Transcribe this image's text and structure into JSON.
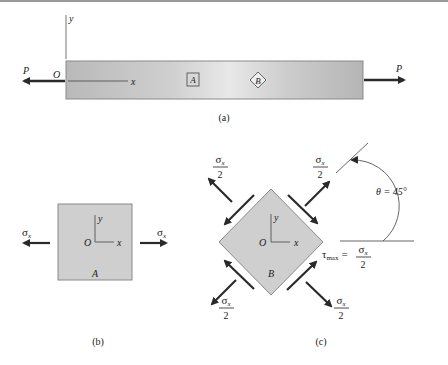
{
  "figure": {
    "panels": [
      {
        "id": "a",
        "caption": "(a)",
        "description": "Bar in uniaxial tension with elements A and B",
        "load_label": "P",
        "origin_label": "O",
        "x_axis_label": "x",
        "y_axis_label": "y",
        "element_a_label": "A",
        "element_b_label": "B"
      },
      {
        "id": "b",
        "caption": "(b)",
        "description": "Element A with normal stress",
        "stress_left": "σ",
        "stress_right": "σ",
        "stress_subscript": "x",
        "origin_label": "O",
        "x_axis_label": "x",
        "y_axis_label": "y",
        "element_label": "A"
      },
      {
        "id": "c",
        "caption": "(c)",
        "description": "Element B rotated 45 degrees with normal and shear stresses",
        "stress_numerator": "σ",
        "stress_subscript": "x",
        "stress_denominator": "2",
        "origin_label": "O",
        "x_axis_label": "x",
        "y_axis_label": "y",
        "element_label": "B",
        "angle_label": "θ = 45°",
        "tau_symbol": "τ",
        "tau_subscript": "max",
        "tau_equals": "="
      }
    ],
    "colors": {
      "element_fill": "#cfcfcf",
      "arrow": "#2a2a2a",
      "line": "#555555"
    }
  }
}
